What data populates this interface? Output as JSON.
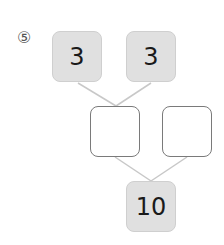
{
  "problem": {
    "number_label": "⑤",
    "top_left": "3",
    "top_right": "3",
    "middle_left": "",
    "middle_right": "",
    "bottom": "10"
  },
  "colors": {
    "filled_box": "#e0e0e0",
    "filled_border": "#cfcfcf",
    "empty_border": "#7a7a7a",
    "connector_line": "#c8c8c8"
  }
}
